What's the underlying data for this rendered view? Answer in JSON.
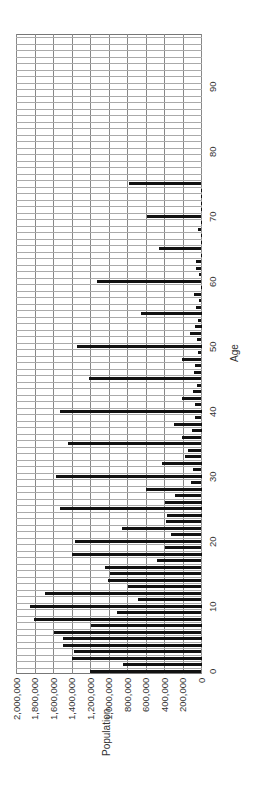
{
  "chart_data": {
    "type": "bar",
    "orientation": "rotated 90deg counterclockwise (bars horizontal on page, vertical in chart frame)",
    "title": "",
    "xlabel": "Age",
    "ylabel": "Population",
    "ylim": [
      0,
      2000000
    ],
    "xlim": [
      0,
      98
    ],
    "grid": true,
    "legend": null,
    "y_ticks": [
      "0",
      "200,000",
      "400,000",
      "600,000",
      "800,000",
      "1,000,000",
      "1,200,000",
      "1,400,000",
      "1,600,000",
      "1,800,000",
      "2,000,000"
    ],
    "x_ticks": [
      "0",
      "10",
      "20",
      "30",
      "40",
      "50",
      "60",
      "70",
      "80",
      "90"
    ],
    "categories": [
      0,
      1,
      2,
      3,
      4,
      5,
      6,
      7,
      8,
      9,
      10,
      11,
      12,
      13,
      14,
      15,
      16,
      17,
      18,
      19,
      20,
      21,
      22,
      23,
      24,
      25,
      26,
      27,
      28,
      29,
      30,
      31,
      32,
      33,
      34,
      35,
      36,
      37,
      38,
      39,
      40,
      41,
      42,
      43,
      44,
      45,
      46,
      47,
      48,
      49,
      50,
      51,
      52,
      53,
      54,
      55,
      56,
      57,
      58,
      59,
      60,
      61,
      62,
      63,
      64,
      65,
      66,
      67,
      68,
      69,
      70,
      71,
      72,
      73,
      74,
      75,
      76,
      77,
      78,
      79,
      80,
      81,
      82,
      83,
      84,
      85,
      86,
      87,
      88,
      89,
      90,
      91,
      92,
      93,
      94,
      95,
      96,
      97,
      98
    ],
    "values": [
      1210000,
      850000,
      1400000,
      1380000,
      1500000,
      1500000,
      1590000,
      1200000,
      1810000,
      910000,
      1850000,
      690000,
      1690000,
      790000,
      1010000,
      990000,
      1040000,
      480000,
      1400000,
      390000,
      1370000,
      330000,
      860000,
      380000,
      375000,
      1525000,
      400000,
      285000,
      600000,
      110000,
      1575000,
      90000,
      425000,
      180000,
      145000,
      1440000,
      215000,
      100000,
      300000,
      65000,
      1525000,
      65000,
      215000,
      95000,
      45000,
      1215000,
      85000,
      65000,
      215000,
      35000,
      1350000,
      45000,
      120000,
      75000,
      35000,
      650000,
      55000,
      30000,
      85000,
      10000,
      1135000,
      30000,
      55000,
      55000,
      10000,
      455000,
      10000,
      10000,
      35000,
      5000,
      585000,
      5000,
      10000,
      10000,
      5000,
      785000,
      0,
      0,
      0,
      0,
      0,
      0,
      0,
      0,
      0,
      0,
      0,
      0,
      0,
      0,
      0,
      0,
      0,
      0,
      0,
      0,
      0,
      0,
      0
    ],
    "bar_color": "#111111",
    "grid_color": "#888888"
  }
}
